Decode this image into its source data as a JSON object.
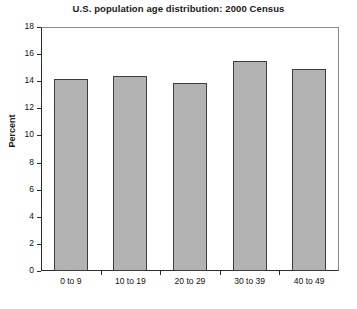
{
  "chart_data": {
    "type": "bar",
    "title": "U.S. population age distribution: 2000 Census",
    "xlabel": "Age",
    "ylabel": "Percent",
    "categories": [
      "0 to 9",
      "10 to 19",
      "20 to 29",
      "30 to 39",
      "40 to 49"
    ],
    "values": [
      14.2,
      14.4,
      13.9,
      15.5,
      14.9
    ],
    "ylim": [
      0,
      18
    ],
    "ytick_labels": [
      "0",
      "2",
      "4",
      "6",
      "8",
      "10",
      "12",
      "14",
      "16",
      "18"
    ],
    "ytick_values": [
      0,
      2,
      4,
      6,
      8,
      10,
      12,
      14,
      16,
      18
    ],
    "grid": false,
    "legend": "none",
    "bar_color": "#b3b3b3",
    "bar_edge_color": "#3d3d3d",
    "axis_color": "#2b2b2b",
    "background": "#ffffff"
  }
}
